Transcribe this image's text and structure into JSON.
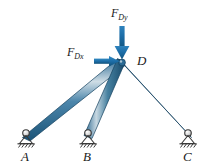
{
  "figure": {
    "background_color": "#ffffff",
    "member_color_dark": "#1f5d86",
    "member_color_mid": "#3d7fa6",
    "member_color_light": "#b8cdd8",
    "arrow_color": "#1d6ea8",
    "label_color": "#1a1a1a",
    "support_color": "#3a3a3a"
  },
  "joints": {
    "D": {
      "label": "D",
      "x": 122,
      "y": 62
    }
  },
  "supports": [
    {
      "label": "A",
      "x": 26,
      "y": 134,
      "type": "pin-support"
    },
    {
      "label": "B",
      "x": 88,
      "y": 134,
      "type": "pin-support"
    },
    {
      "label": "C",
      "x": 188,
      "y": 134,
      "type": "pin-support"
    }
  ],
  "members": [
    {
      "name": "member-AD",
      "from": "A",
      "to": "D"
    },
    {
      "name": "member-BD",
      "from": "B",
      "to": "D"
    },
    {
      "name": "member-CD",
      "from": "C",
      "to": "D"
    }
  ],
  "forces": [
    {
      "name": "force-FDy",
      "symbol": "F",
      "subscript": "Dy",
      "direction": "down",
      "label_x": 113,
      "label_y": 10
    },
    {
      "name": "force-FDx",
      "symbol": "F",
      "subscript": "Dx",
      "direction": "right",
      "label_x": 68,
      "label_y": 48
    }
  ],
  "node_labels": [
    {
      "text": "A",
      "x": 21,
      "y": 152
    },
    {
      "text": "B",
      "x": 83,
      "y": 152
    },
    {
      "text": "C",
      "x": 183,
      "y": 152
    },
    {
      "text": "D",
      "x": 139,
      "y": 56
    }
  ]
}
